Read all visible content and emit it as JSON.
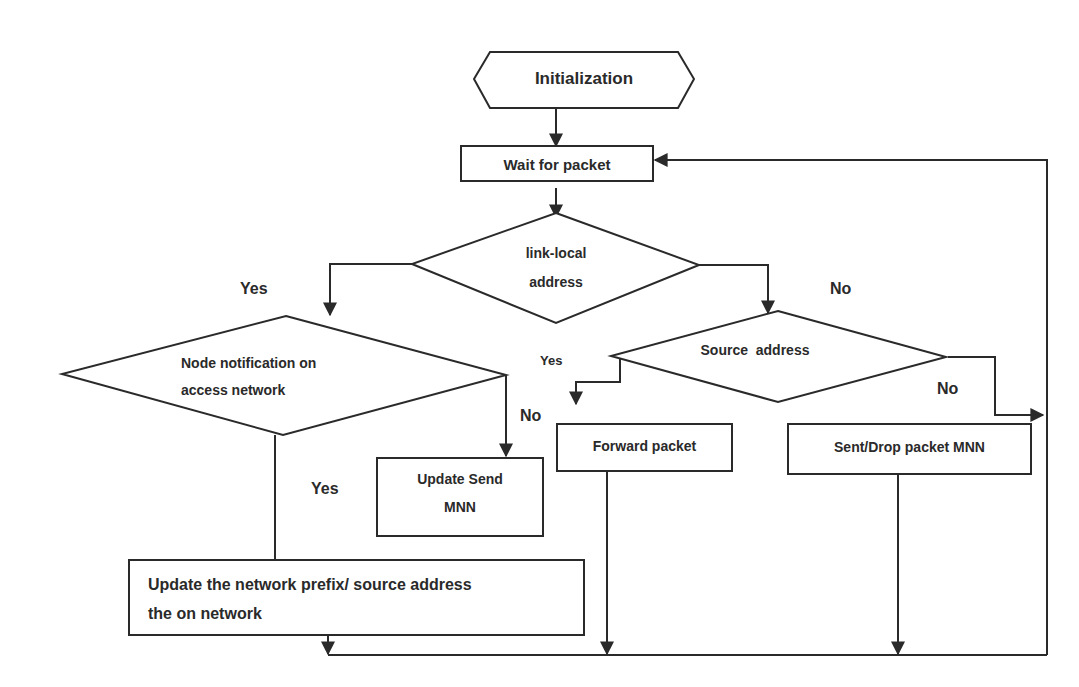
{
  "diagram": {
    "type": "flowchart",
    "colors": {
      "stroke": "#2a2a2a",
      "background": "#ffffff",
      "text": "#2a2a2a"
    },
    "nodes": {
      "init": {
        "shape": "hexagon",
        "label": "Initialization"
      },
      "wait": {
        "shape": "rectangle",
        "label": "Wait for packet"
      },
      "link_local": {
        "shape": "diamond",
        "line1": "link-local",
        "line2": "address"
      },
      "node_notification": {
        "shape": "diamond",
        "line1": "Node notification on",
        "line2": "access network"
      },
      "source_address": {
        "shape": "diamond",
        "label": "Source  address"
      },
      "update_send": {
        "shape": "rectangle",
        "line1": "Update Send",
        "line2": "MNN"
      },
      "forward": {
        "shape": "rectangle",
        "label": "Forward packet"
      },
      "sent_drop": {
        "shape": "rectangle",
        "label": "Sent/Drop packet MNN"
      },
      "update_prefix": {
        "shape": "rectangle",
        "line1": "Update the network prefix/ source address",
        "line2": "the on network"
      }
    },
    "edge_labels": {
      "link_local_yes": "Yes",
      "link_local_no": "No",
      "source_yes": "Yes",
      "source_no": "No",
      "node_no": "No",
      "node_yes": "Yes"
    },
    "edges": [
      {
        "from": "init",
        "to": "wait"
      },
      {
        "from": "wait",
        "to": "link_local"
      },
      {
        "from": "link_local",
        "to": "node_notification",
        "label": "Yes"
      },
      {
        "from": "link_local",
        "to": "source_address",
        "label": "No"
      },
      {
        "from": "node_notification",
        "to": "update_send",
        "label": "No"
      },
      {
        "from": "node_notification",
        "to": "update_prefix",
        "label": "Yes"
      },
      {
        "from": "source_address",
        "to": "forward",
        "label": "Yes"
      },
      {
        "from": "source_address",
        "to": "loop_back",
        "label": "No"
      },
      {
        "from": "update_prefix",
        "to": "bottom_bus"
      },
      {
        "from": "forward",
        "to": "bottom_bus"
      },
      {
        "from": "sent_drop",
        "to": "bottom_bus"
      },
      {
        "from": "bottom_bus",
        "to": "wait"
      }
    ]
  }
}
